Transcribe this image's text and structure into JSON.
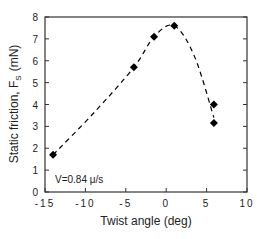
{
  "chart_data": {
    "type": "scatter",
    "title": "",
    "xlabel": "Twist angle (deg)",
    "ylabel": "Static friction, F",
    "ylabel_subscript": "S",
    "ylabel_unit": "(mN)",
    "xlim": [
      -15,
      10
    ],
    "ylim": [
      0,
      8
    ],
    "xticks": [
      -15,
      -10,
      -5,
      0,
      5,
      10
    ],
    "xtick_labels": [
      "-15",
      "-10",
      "-5",
      "0",
      "5",
      "10"
    ],
    "yticks": [
      0,
      1,
      2,
      3,
      4,
      5,
      6,
      7,
      8
    ],
    "ytick_labels": [
      "0",
      "1",
      "2",
      "3",
      "4",
      "5",
      "6",
      "7",
      "8"
    ],
    "grid": false,
    "legend": null,
    "annotation": "V=0.84  μ/s",
    "series": [
      {
        "name": "measured",
        "marker": "diamond",
        "color": "#000000",
        "x": [
          -14.0,
          -4.0,
          -1.5,
          1.0,
          5.9,
          5.9
        ],
        "y": [
          1.7,
          5.7,
          7.1,
          7.6,
          4.0,
          3.15
        ]
      },
      {
        "name": "fit",
        "style": "dashed",
        "color": "#000000",
        "x": [
          -14.0,
          -9.0,
          -4.0,
          -1.5,
          1.0,
          3.5,
          5.9
        ],
        "y": [
          1.7,
          3.6,
          5.7,
          7.1,
          7.6,
          6.2,
          3.4
        ]
      }
    ]
  }
}
